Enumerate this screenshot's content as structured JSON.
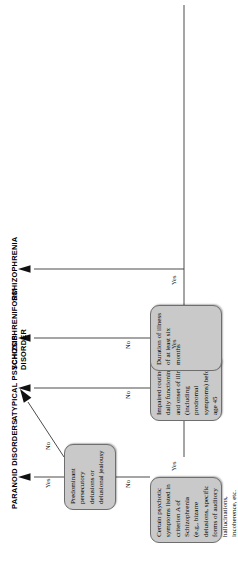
{
  "figure": {
    "type": "flowchart",
    "orientation": "rotated-90-landscape-on-portrait-page",
    "box_fill": "#c9c9c9",
    "box_stroke": "#6e6e6e",
    "line_color": "#2b2b2b"
  },
  "nodes": [
    {
      "id": "criterion-a",
      "text": "Certain psychotic symptoms listed in criterion A of Schizophrenia (e.g., bizarre delusions, specific forms of auditory hallucinations, incoherence, etc."
    },
    {
      "id": "impaired-functioning",
      "text": "Impaired routine daily functioning and onset of illness (including prodromal symptoms) before age 45"
    },
    {
      "id": "duration",
      "text": "Duration of illness of at least six months"
    },
    {
      "id": "persecutory",
      "text": "Predominant persecutory delusions or delusional jealousy"
    }
  ],
  "outcomes": [
    {
      "id": "paranoid",
      "label": "PARANOID DISORDERS"
    },
    {
      "id": "atypical",
      "label": "ATYPICAL PSYCHOSIS"
    },
    {
      "id": "schizophreniform",
      "label": "SCHIZOPHRENIFORM\nDISORDER"
    },
    {
      "id": "schizophrenia",
      "label": "SCHIZOPHRENIA"
    }
  ],
  "edges": [
    {
      "id": "e-criterion-no",
      "label": "No"
    },
    {
      "id": "e-criterion-yes",
      "label": "Yes"
    },
    {
      "id": "e-impaired-no",
      "label": "No"
    },
    {
      "id": "e-impaired-yes",
      "label": "Yes"
    },
    {
      "id": "e-duration-no",
      "label": "No"
    },
    {
      "id": "e-duration-yes",
      "label": "Yes"
    },
    {
      "id": "e-persecutory-yes",
      "label": "Yes"
    },
    {
      "id": "e-persecutory-no",
      "label": "No"
    }
  ]
}
